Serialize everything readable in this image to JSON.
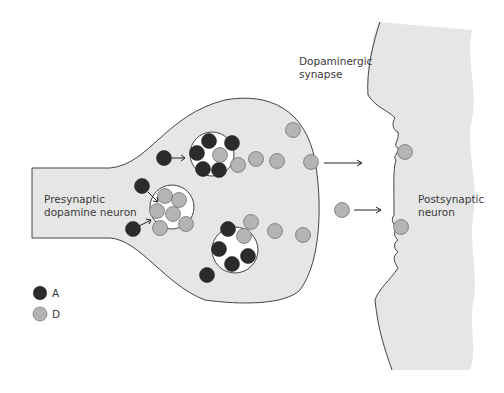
{
  "labels": {
    "synapse_line1": "Dopaminergic",
    "synapse_line2": "synapse",
    "pre_line1": "Presynaptic",
    "pre_line2": "dopamine neuron",
    "post_line1": "Postsynaptic",
    "post_line2": "neuron"
  },
  "legend": {
    "items": [
      {
        "label": "A",
        "color": "#2b2b2b"
      },
      {
        "label": "D",
        "color": "#b4b4b4"
      }
    ]
  },
  "colors": {
    "cell_fill": "#e6e6e6",
    "outline": "#444444",
    "dark_molecule": "#2b2b2b",
    "light_molecule": "#b4b4b4"
  }
}
